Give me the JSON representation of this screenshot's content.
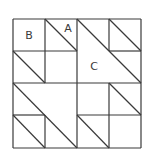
{
  "diagram": {
    "type": "quilt-block",
    "grid": {
      "rows": 4,
      "cols": 4,
      "left": 13,
      "top": 19,
      "cell": 32.2
    },
    "line_color": "#3a3a3a",
    "labels": [
      {
        "text": "B",
        "x": 29,
        "y": 39
      },
      {
        "text": "A",
        "x": 68,
        "y": 32
      },
      {
        "text": "C",
        "x": 94,
        "y": 70
      }
    ],
    "segments": [
      [
        13,
        19,
        141,
        19
      ],
      [
        13,
        148,
        141,
        148
      ],
      [
        13,
        19,
        13,
        148
      ],
      [
        141,
        19,
        141,
        148
      ],
      [
        45,
        19,
        45,
        83
      ],
      [
        77,
        19,
        77,
        148
      ],
      [
        109,
        19,
        109,
        51
      ],
      [
        13,
        51,
        77,
        51
      ],
      [
        109,
        51,
        141,
        51
      ],
      [
        13,
        83,
        141,
        83
      ],
      [
        13,
        115,
        45,
        115
      ],
      [
        45,
        115,
        45,
        148
      ],
      [
        77,
        115,
        141,
        115
      ],
      [
        109,
        83,
        109,
        148
      ],
      [
        45,
        19,
        77,
        51
      ],
      [
        109,
        19,
        141,
        51
      ],
      [
        77,
        19,
        141,
        83
      ],
      [
        13,
        51,
        45,
        83
      ],
      [
        13,
        83,
        77,
        148
      ],
      [
        13,
        115,
        45,
        148
      ],
      [
        77,
        115,
        109,
        148
      ],
      [
        109,
        83,
        141,
        115
      ]
    ]
  }
}
